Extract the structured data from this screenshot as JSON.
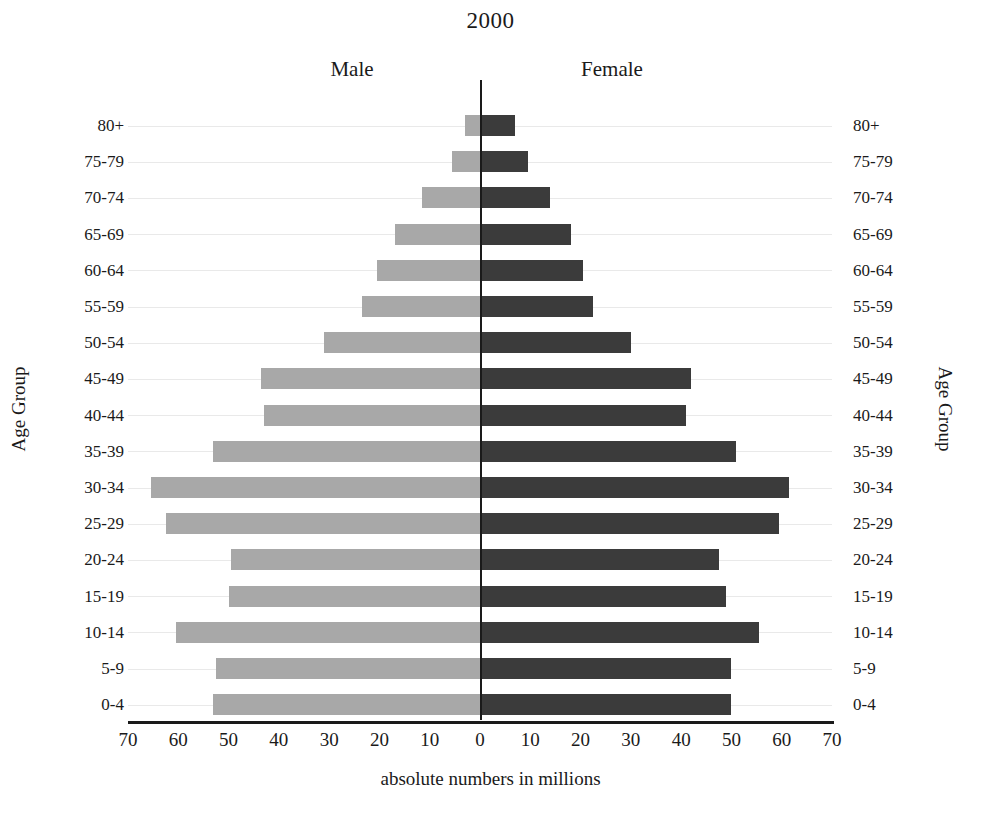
{
  "chart_data": {
    "type": "bar",
    "subtype": "population-pyramid",
    "title": "2000",
    "xlabel": "absolute numbers in millions",
    "ylabel": "Age Group",
    "ylabel_right": "Age Group",
    "grid": true,
    "xlim": [
      -70,
      70
    ],
    "xticks": [
      "70",
      "60",
      "50",
      "40",
      "30",
      "20",
      "10",
      "0",
      "10",
      "20",
      "30",
      "40",
      "50",
      "60",
      "70"
    ],
    "xtick_values": [
      -70,
      -60,
      -50,
      -40,
      -30,
      -20,
      -10,
      0,
      10,
      20,
      30,
      40,
      50,
      60,
      70
    ],
    "legend_position": "top",
    "categories": [
      "80+",
      "75-79",
      "70-74",
      "65-69",
      "60-64",
      "55-59",
      "50-54",
      "45-49",
      "40-44",
      "35-39",
      "30-34",
      "25-29",
      "20-24",
      "15-19",
      "10-14",
      "5-9",
      "0-4"
    ],
    "series": [
      {
        "name": "Male",
        "color": "#a8a8a8",
        "side": "left",
        "values": [
          3.0,
          5.5,
          11.5,
          17.0,
          20.5,
          23.5,
          31.0,
          43.5,
          43.0,
          53.0,
          65.5,
          62.5,
          49.5,
          50.0,
          60.5,
          52.5,
          53.0
        ]
      },
      {
        "name": "Female",
        "color": "#3b3b3b",
        "side": "right",
        "values": [
          7.0,
          9.5,
          14.0,
          18.0,
          20.5,
          22.5,
          30.0,
          42.0,
          41.0,
          51.0,
          61.5,
          59.5,
          47.5,
          49.0,
          55.5,
          50.0,
          50.0
        ]
      }
    ]
  },
  "header": {
    "male_label": "Male",
    "female_label": "Female"
  }
}
